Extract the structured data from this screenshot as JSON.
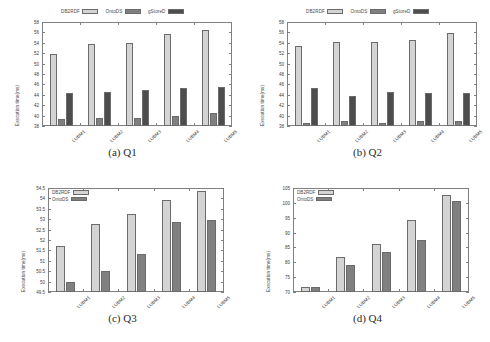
{
  "figure": {
    "background": "#ffffff",
    "series_colors": {
      "DB2RDF": "#d4d4d4",
      "OntoDS": "#808080",
      "gStoreD": "#4d4d4d"
    }
  },
  "chart_data": [
    {
      "id": "q1",
      "type": "bar",
      "title": "(a) Q1",
      "caption": "(a) Q1",
      "xlabel": "",
      "ylabel": "Execution time(ms)",
      "categories": [
        "LUBM1",
        "LUBM2",
        "LUBM3",
        "LUBM4",
        "LUBM5"
      ],
      "ylim": [
        38,
        58
      ],
      "yticks": [
        38,
        40,
        42,
        44,
        46,
        48,
        50,
        52,
        54,
        56,
        58
      ],
      "ytick_labels": [
        "38",
        "40",
        "42",
        "44",
        "46",
        "48",
        "50",
        "52",
        "54",
        "56",
        "58"
      ],
      "grid": false,
      "legend_position": "above-center",
      "series": [
        {
          "name": "DB2RDF",
          "color": "#d4d4d4",
          "values": [
            51.8,
            53.7,
            53.95,
            55.6,
            56.4
          ]
        },
        {
          "name": "OntoDS",
          "color": "#808080",
          "values": [
            39.35,
            39.6,
            39.5,
            39.85,
            40.5
          ]
        },
        {
          "name": "gStoreD",
          "color": "#4d4d4d",
          "values": [
            44.3,
            44.5,
            44.9,
            45.25,
            45.5
          ]
        }
      ]
    },
    {
      "id": "q2",
      "type": "bar",
      "title": "(b) Q2",
      "caption": "(b) Q2",
      "xlabel": "",
      "ylabel": "Execution time(ms)",
      "categories": [
        "LUBM1",
        "LUBM2",
        "LUBM3",
        "LUBM4",
        "LUBM5"
      ],
      "ylim": [
        38,
        58
      ],
      "yticks": [
        38,
        40,
        42,
        44,
        46,
        48,
        50,
        52,
        54,
        56,
        58
      ],
      "ytick_labels": [
        "38",
        "40",
        "42",
        "44",
        "46",
        "48",
        "50",
        "52",
        "54",
        "56",
        "58"
      ],
      "grid": false,
      "legend_position": "above-center",
      "series": [
        {
          "name": "DB2RDF",
          "color": "#d4d4d4",
          "values": [
            53.3,
            54.1,
            54.1,
            54.5,
            55.9
          ]
        },
        {
          "name": "OntoDS",
          "color": "#808080",
          "values": [
            38.6,
            38.9,
            38.65,
            38.9,
            39.0
          ]
        },
        {
          "name": "gStoreD",
          "color": "#4d4d4d",
          "values": [
            45.4,
            43.7,
            44.6,
            44.3,
            44.35
          ]
        }
      ]
    },
    {
      "id": "q3",
      "type": "bar",
      "title": "(c) Q3",
      "caption": "(c) Q3",
      "xlabel": "",
      "ylabel": "Execution time(ms)",
      "categories": [
        "LUBM1",
        "LUBM2",
        "LUBM3",
        "LUBM4",
        "LUBM5"
      ],
      "ylim": [
        49.5,
        54.5
      ],
      "yticks": [
        49.5,
        50,
        50.5,
        51,
        51.5,
        52,
        52.5,
        53,
        53.5,
        54,
        54.5
      ],
      "ytick_labels": [
        "49.5",
        "50",
        "50.5",
        "51",
        "51.5",
        "52",
        "52.5",
        "53",
        "53.5",
        "54",
        "54.5"
      ],
      "grid": false,
      "legend_position": "inside-top-left",
      "series": [
        {
          "name": "DB2RDF",
          "color": "#d4d4d4",
          "values": [
            51.7,
            52.78,
            53.27,
            53.9,
            54.35
          ]
        },
        {
          "name": "OntoDS",
          "color": "#808080",
          "values": [
            49.97,
            50.52,
            51.35,
            52.87,
            52.95
          ]
        }
      ]
    },
    {
      "id": "q4",
      "type": "bar",
      "title": "(d) Q4",
      "caption": "(d) Q4",
      "xlabel": "",
      "ylabel": "Execution time(ms)",
      "categories": [
        "LUBM1",
        "LUBM2",
        "LUBM3",
        "LUBM4",
        "LUBM5"
      ],
      "ylim": [
        70,
        105
      ],
      "yticks": [
        70,
        75,
        80,
        85,
        90,
        95,
        100,
        105
      ],
      "ytick_labels": [
        "70",
        "75",
        "80",
        "85",
        "90",
        "95",
        "100",
        "105"
      ],
      "grid": false,
      "legend_position": "inside-top-left",
      "series": [
        {
          "name": "DB2RDF",
          "color": "#d4d4d4",
          "values": [
            71.8,
            81.7,
            86.2,
            94.1,
            102.5
          ]
        },
        {
          "name": "OntoDS",
          "color": "#808080",
          "values": [
            71.6,
            79.0,
            83.4,
            87.6,
            100.6
          ]
        }
      ]
    }
  ]
}
